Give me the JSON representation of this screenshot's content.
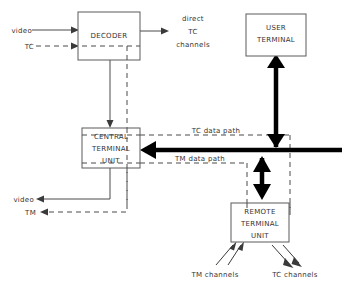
{
  "diagram": {
    "background_color": "#ffffff",
    "line_color": "#4a4a4a",
    "bus_color": "#000000",
    "text_color": "#333333",
    "nodes": [
      {
        "id": "decoder",
        "name": "decoder-box",
        "lines": [
          "DECODER"
        ],
        "x": 78,
        "y": 12,
        "w": 62,
        "h": 48
      },
      {
        "id": "central_terminal_unit",
        "name": "central-terminal-unit-box",
        "lines": [
          "CENTRAL",
          "TERMINAL",
          "UNIT"
        ],
        "x": 82,
        "y": 128,
        "w": 58,
        "h": 40
      },
      {
        "id": "user_terminal",
        "name": "user-terminal-box",
        "lines": [
          "USER",
          "TERMINAL"
        ],
        "x": 246,
        "y": 14,
        "w": 60,
        "h": 42
      },
      {
        "id": "remote_terminal_unit",
        "name": "remote-terminal-unit-box",
        "lines": [
          "REMOTE",
          "TERMINAL",
          "UNIT"
        ],
        "x": 231,
        "y": 203,
        "w": 58,
        "h": 39
      }
    ],
    "edge_labels": {
      "video_in": "video",
      "tc_in": "TC",
      "direct_line1": "direct",
      "direct_line2": "TC",
      "direct_line3": "channels",
      "tc_data_path": "TC data path",
      "tm_data_path": "TM data path",
      "video_out": "video",
      "tm_out": "TM",
      "tm_channels": "TM channels",
      "tc_channels": "TC channels"
    }
  }
}
